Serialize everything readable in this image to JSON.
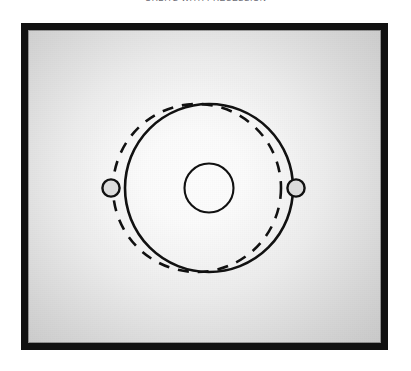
{
  "figure": {
    "title": "ORBITS WITH PRECESSION",
    "title_clipped": true,
    "panel": {
      "frame_color": "#111111",
      "frame_border_width": 7,
      "background_center_color": "#fdfdfd",
      "background_edge_color": "#c6c6c6"
    }
  },
  "diagram": {
    "type": "orbital-precession-schematic",
    "stroke_color": "#111111",
    "body_fill_color": "#dcdcdc",
    "central_body": {
      "label": "central-body",
      "cx": 209,
      "cy": 188,
      "r": 24.5,
      "stroke_width": 2.1,
      "fill": "none"
    },
    "solid_orbit": {
      "label": "current-orbit",
      "style": "solid",
      "cx": 209,
      "cy": 188,
      "r": 84,
      "stroke_width": 2.6
    },
    "dashed_orbit": {
      "label": "precessed-orbit",
      "style": "dashed",
      "cx": 197,
      "cy": 188,
      "rx": 84,
      "ry": 84,
      "stroke_width": 2.6,
      "dash_pattern": "11 9"
    },
    "orbiting_bodies": [
      {
        "label": "body-on-dashed-orbit",
        "cx": 111,
        "cy": 188,
        "r": 8.6,
        "stroke_width": 2.4
      },
      {
        "label": "body-on-solid-orbit",
        "cx": 296,
        "cy": 188,
        "r": 8.6,
        "stroke_width": 2.4
      }
    ]
  }
}
